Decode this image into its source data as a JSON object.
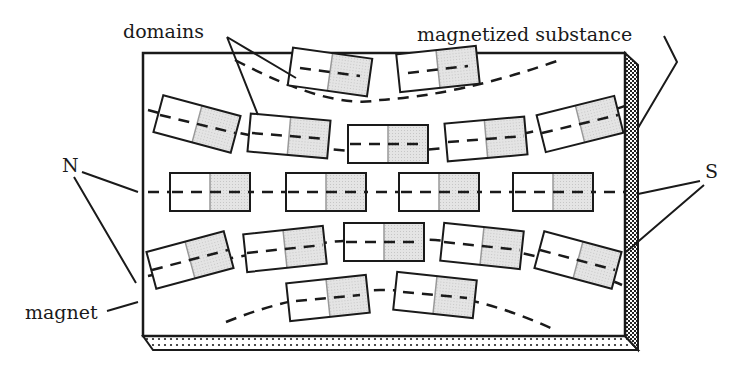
{
  "diagram": {
    "labels": {
      "domains": "domains",
      "substance": "magnetized substance",
      "north": "N",
      "south": "S",
      "magnet": "magnet"
    },
    "colors": {
      "stroke": "#1a1a1a",
      "shade": "#d8d8d8",
      "background": "#ffffff"
    },
    "domains": [
      {
        "row": 1,
        "cx": 330,
        "cy": 72,
        "angle": 8
      },
      {
        "row": 1,
        "cx": 438,
        "cy": 69,
        "angle": -6
      },
      {
        "row": 2,
        "cx": 197,
        "cy": 124,
        "angle": 15
      },
      {
        "row": 2,
        "cx": 289,
        "cy": 136,
        "angle": 5
      },
      {
        "row": 2,
        "cx": 388,
        "cy": 144,
        "angle": 0
      },
      {
        "row": 2,
        "cx": 486,
        "cy": 139,
        "angle": -5
      },
      {
        "row": 2,
        "cx": 580,
        "cy": 124,
        "angle": -14
      },
      {
        "row": 3,
        "cx": 210,
        "cy": 192,
        "angle": 0
      },
      {
        "row": 3,
        "cx": 326,
        "cy": 192,
        "angle": 0
      },
      {
        "row": 3,
        "cx": 439,
        "cy": 192,
        "angle": 0
      },
      {
        "row": 3,
        "cx": 553,
        "cy": 192,
        "angle": 0
      },
      {
        "row": 4,
        "cx": 190,
        "cy": 260,
        "angle": -15
      },
      {
        "row": 4,
        "cx": 285,
        "cy": 249,
        "angle": -6
      },
      {
        "row": 4,
        "cx": 384,
        "cy": 242,
        "angle": 0
      },
      {
        "row": 4,
        "cx": 482,
        "cy": 246,
        "angle": 6
      },
      {
        "row": 4,
        "cx": 578,
        "cy": 260,
        "angle": 15
      },
      {
        "row": 5,
        "cx": 328,
        "cy": 298,
        "angle": -6
      },
      {
        "row": 5,
        "cx": 435,
        "cy": 295,
        "angle": 6
      }
    ]
  }
}
